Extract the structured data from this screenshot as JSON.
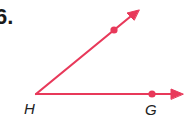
{
  "problem": {
    "number": "6."
  },
  "figure": {
    "type": "angle",
    "color": "#e8395a",
    "vertex": {
      "label": "H",
      "x": 36,
      "y": 94
    },
    "rays": [
      {
        "name": "upper-ray",
        "tip": {
          "x": 139,
          "y": 10
        },
        "point": {
          "x": 114,
          "y": 30,
          "label": ""
        }
      },
      {
        "name": "lower-ray",
        "tip": {
          "x": 183,
          "y": 94
        },
        "point": {
          "x": 152,
          "y": 94,
          "label": "G"
        }
      }
    ]
  },
  "labels": {
    "vertex": "H",
    "point_g": "G"
  }
}
